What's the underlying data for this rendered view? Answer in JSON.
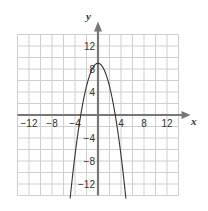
{
  "chart_data": {
    "type": "line",
    "title": "",
    "xlabel": "x",
    "ylabel": "y",
    "xlim": [
      -14,
      14
    ],
    "ylim": [
      -14,
      14
    ],
    "grid": true,
    "grid_step": 2,
    "x_ticks": [
      -12,
      -8,
      -4,
      4,
      8,
      12
    ],
    "y_ticks": [
      12,
      8,
      4,
      -4,
      -8,
      -12
    ],
    "x_tick_labels": [
      "−12",
      "−8",
      "−4",
      "4",
      "8",
      "12"
    ],
    "y_tick_labels": [
      "12",
      "8",
      "4",
      "−4",
      "−8",
      "−12"
    ],
    "series": [
      {
        "name": "parabola",
        "equation": "y = 9 - x^2",
        "x": [
          -4.8,
          -4,
          -3,
          -2,
          -1,
          0,
          1,
          2,
          3,
          4,
          4.8
        ],
        "values": [
          -14,
          -7,
          0,
          5,
          8,
          9,
          8,
          5,
          0,
          -7,
          -14
        ]
      }
    ],
    "legend": null
  },
  "colors": {
    "grid": "#cfcfcf",
    "axis": "#777777",
    "curve": "#333333",
    "text": "#333333"
  }
}
